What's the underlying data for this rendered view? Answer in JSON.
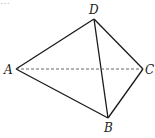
{
  "diagram": {
    "type": "tetrahedron",
    "partial_top_text": "…",
    "vertices": {
      "A": {
        "label": "A",
        "x": 16,
        "y": 69,
        "lx": 4,
        "ly": 74
      },
      "B": {
        "label": "B",
        "x": 108,
        "y": 118,
        "lx": 104,
        "ly": 132
      },
      "C": {
        "label": "C",
        "x": 143,
        "y": 69,
        "lx": 145,
        "ly": 74
      },
      "D": {
        "label": "D",
        "x": 94,
        "y": 19,
        "lx": 89,
        "ly": 14
      }
    },
    "edges": [
      {
        "from": "A",
        "to": "D",
        "style": "solid"
      },
      {
        "from": "A",
        "to": "B",
        "style": "solid"
      },
      {
        "from": "D",
        "to": "B",
        "style": "solid"
      },
      {
        "from": "D",
        "to": "C",
        "style": "solid"
      },
      {
        "from": "B",
        "to": "C",
        "style": "solid"
      },
      {
        "from": "A",
        "to": "C",
        "style": "dashed"
      }
    ],
    "colors": {
      "line": "#1a1a1a",
      "dashed": "#555555",
      "background": "#ffffff"
    }
  }
}
